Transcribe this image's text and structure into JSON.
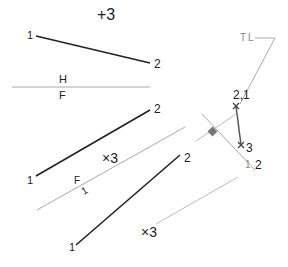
{
  "diagram": {
    "top_view": {
      "point_1_label": "1",
      "point_2_label": "2",
      "point_3_label": "+3"
    },
    "fold_line_hf": {
      "upper_label": "H",
      "lower_label": "F"
    },
    "front_view": {
      "point_1_label": "1",
      "point_2_label": "2",
      "point_3_label": "×3"
    },
    "fold_line_f1": {
      "upper_label": "F",
      "lower_label": "1"
    },
    "aux_view_1": {
      "point_1_label": "1",
      "point_2_label": "2",
      "point_3_label": "×3"
    },
    "aux_view_2": {
      "true_length_label": "TL",
      "point_21_label": "2,1",
      "point_3_label": "3",
      "fold_upper_label": "1",
      "fold_lower_label": "2"
    },
    "colors": {
      "object_line": "#222222",
      "construction_line": "#aaaaaa",
      "perpendicular_marker": "#777777"
    }
  }
}
